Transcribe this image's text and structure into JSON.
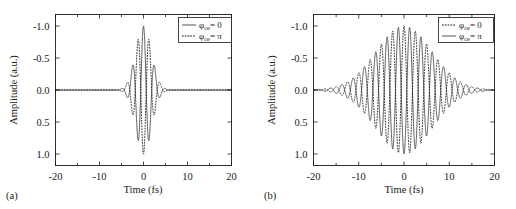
{
  "figure": {
    "panels": [
      {
        "tag": "(a)",
        "xlabel": "Time (fs)",
        "ylabel": "Amplitude (a.u.)",
        "xticks": [
          "-20",
          "-10",
          "0",
          "10",
          "20"
        ],
        "yticks": [
          "1.0",
          "0.5",
          "0.0",
          "-0.5",
          "-1.0"
        ],
        "legend": [
          {
            "style": "solid",
            "symbol": "φ",
            "sub": "ce",
            "value": "= 0"
          },
          {
            "style": "dashed",
            "symbol": "φ",
            "sub": "ce",
            "value": "= π"
          }
        ]
      },
      {
        "tag": "(b)",
        "xlabel": "Time (fs)",
        "ylabel": "Amplitude (a.u.)",
        "xticks": [
          "-20",
          "-10",
          "0",
          "10",
          "20"
        ],
        "yticks": [
          "1.0",
          "0.5",
          "0.0",
          "-0.5",
          "-1.0"
        ],
        "legend": [
          {
            "style": "dashed",
            "symbol": "φ",
            "sub": "ce",
            "value": "= 0"
          },
          {
            "style": "solid",
            "symbol": "φ",
            "sub": "ce",
            "value": "= π"
          }
        ]
      }
    ]
  },
  "chart_data": [
    {
      "type": "line",
      "panel": "(a)",
      "title": "",
      "xlabel": "Time (fs)",
      "ylabel": "Amplitude (a.u.)",
      "xlim": [
        -20,
        20
      ],
      "ylim": [
        -1.18,
        1.18
      ],
      "xticks": [
        -20,
        -10,
        0,
        10,
        20
      ],
      "yticks": [
        -1.0,
        -0.5,
        0.0,
        0.5,
        1.0
      ],
      "grid": false,
      "legend_position": "top-right",
      "envelope": "gaussian",
      "pulse_fwhm_fs": 4.2,
      "carrier_period_fs": 2.5,
      "series": [
        {
          "name": "φce = 0",
          "style": "solid",
          "color": "#2a2a2a",
          "cep_phase_rad": 0,
          "peak_amplitude": 1.0,
          "description": "Cosine-carrier few-cycle pulse centered at t = 0; single dominant positive peak reaching +1.0 at t = 0, flanking minima near -0.78 at t = +/-1.25 fs, decaying to 0 beyond |t| ~ 7 fs"
        },
        {
          "name": "φce = π",
          "style": "dashed",
          "color": "#1a1a1a",
          "cep_phase_rad": 3.14159,
          "peak_amplitude": 1.0,
          "description": "Inverted-cosine few-cycle pulse; dominant negative peak reaching -1.0 at t = 0, flanking maxima near +0.78 at t = +/-1.25 fs, decaying to 0 beyond |t| ~ 7 fs"
        }
      ]
    },
    {
      "type": "line",
      "panel": "(b)",
      "title": "",
      "xlabel": "Time (fs)",
      "ylabel": "Amplitude (a.u.)",
      "xlim": [
        -20,
        20
      ],
      "ylim": [
        -1.18,
        1.18
      ],
      "xticks": [
        -20,
        -10,
        0,
        10,
        20
      ],
      "yticks": [
        -1.0,
        -0.5,
        0.0,
        0.5,
        1.0
      ],
      "grid": false,
      "legend_position": "top-right",
      "envelope": "gaussian",
      "pulse_fwhm_fs": 14.5,
      "carrier_period_fs": 2.5,
      "series": [
        {
          "name": "φce = 0",
          "style": "dashed",
          "color": "#1a1a1a",
          "cep_phase_rad": 0,
          "peak_amplitude": 1.0,
          "description": "Long multi-cycle pulse with cosine carrier; many oscillations under a broad gaussian envelope spanning the full -20 to 20 fs window, peak +1.0 near t = 0"
        },
        {
          "name": "φce = π",
          "style": "solid",
          "color": "#2a2a2a",
          "cep_phase_rad": 3.14159,
          "peak_amplitude": 1.0,
          "description": "Long multi-cycle pulse with inverted carrier, offset half a period from the dashed curve, same broad gaussian envelope"
        }
      ]
    }
  ]
}
